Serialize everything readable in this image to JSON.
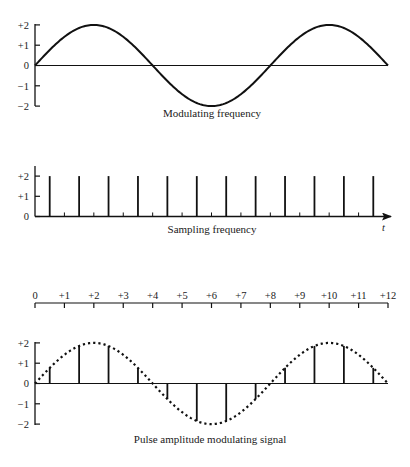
{
  "chart_data": [
    {
      "type": "line",
      "title": "Modulating frequency",
      "y_ticks": [
        "+2",
        "+1",
        "0",
        "-1",
        "-2"
      ],
      "y_tick_values": [
        2,
        1,
        0,
        -1,
        -2
      ],
      "ylim": [
        -2,
        2
      ],
      "xlim": [
        0,
        12
      ],
      "series": [
        {
          "name": "modulating sine",
          "amplitude": 2,
          "period": 8,
          "phase": 0,
          "style": "solid"
        }
      ]
    },
    {
      "type": "bar",
      "title": "Sampling frequency",
      "xlabel": "t",
      "y_ticks": [
        "+2",
        "+1",
        "0"
      ],
      "y_tick_values": [
        2,
        1,
        0
      ],
      "ylim": [
        0,
        2
      ],
      "pulse_x": [
        0.5,
        1.5,
        2.5,
        3.5,
        4.5,
        5.5,
        6.5,
        7.5,
        8.5,
        9.5,
        10.5,
        11.5
      ],
      "pulse_height": 2,
      "minor_tick_x": [
        1,
        2,
        3,
        4,
        5,
        6,
        7,
        8,
        9,
        10,
        11
      ],
      "minor_tick_height": 0.2
    },
    {
      "type": "table",
      "title": "Time scale",
      "tick_labels": [
        "0",
        "+1",
        "+2",
        "+3",
        "+4",
        "+5",
        "+6",
        "+7",
        "+8",
        "+9",
        "+10",
        "+11",
        "+12"
      ],
      "tick_values": [
        0,
        1,
        2,
        3,
        4,
        5,
        6,
        7,
        8,
        9,
        10,
        11,
        12
      ]
    },
    {
      "type": "bar",
      "title": "Pulse amplitude modulating signal",
      "y_ticks": [
        "+2",
        "+1",
        "0",
        "-1",
        "-2"
      ],
      "y_tick_values": [
        2,
        1,
        0,
        -1,
        -2
      ],
      "ylim": [
        -2,
        2
      ],
      "xlim": [
        0,
        12
      ],
      "envelope": {
        "amplitude": 2,
        "period": 8,
        "style": "dotted"
      },
      "samples_x": [
        0.5,
        1.5,
        2.5,
        3.5,
        4.5,
        5.5,
        6.5,
        7.5,
        8.5,
        9.5,
        10.5,
        11.5
      ],
      "samples_y": [
        0.77,
        1.85,
        1.85,
        0.77,
        -0.77,
        -1.85,
        -1.85,
        -0.77,
        0.77,
        1.85,
        1.85,
        0.77
      ]
    }
  ]
}
